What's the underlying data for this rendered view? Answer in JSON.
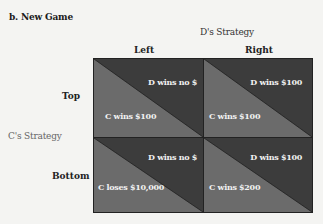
{
  "title": "b. New Game",
  "column_player_label": "D's Strategy",
  "row_player_label": "C's Strategy",
  "columns": [
    "Left",
    "Right"
  ],
  "rows": [
    "Top",
    "Bottom"
  ],
  "colors": {
    "dark": "#3c3c3c",
    "light": "#6b6b6b",
    "border": "#222222"
  },
  "cells": [
    {
      "row": "Top",
      "col": "Left",
      "d_payoff": "D wins no $",
      "c_payoff": "C wins $100"
    },
    {
      "row": "Top",
      "col": "Right",
      "d_payoff": "D wins $100",
      "c_payoff": "C wins $100"
    },
    {
      "row": "Bottom",
      "col": "Left",
      "d_payoff": "D wins no $",
      "c_payoff": "C loses $10,000"
    },
    {
      "row": "Bottom",
      "col": "Right",
      "d_payoff": "D wins $100",
      "c_payoff": "C wins $200"
    }
  ]
}
